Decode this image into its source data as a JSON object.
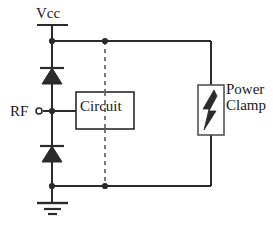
{
  "diagram": {
    "type": "schematic",
    "colors": {
      "line": "#2b2b2b",
      "dashed_line": "#6b6b6b",
      "text": "#1a1a1a",
      "background": "#ffffff",
      "fill": "#2b2b2b"
    },
    "labels": {
      "vcc": "Vcc",
      "rf": "RF",
      "circuit": "Circuit",
      "power_clamp_line1": "Power",
      "power_clamp_line2": "Clamp"
    },
    "components": [
      {
        "name": "vcc-terminal",
        "kind": "supply-rail-terminal",
        "label": "Vcc"
      },
      {
        "name": "upper-diode",
        "kind": "diode",
        "orientation": "pointing-up",
        "between": [
          "rf-node",
          "vcc-rail"
        ]
      },
      {
        "name": "lower-diode",
        "kind": "diode",
        "orientation": "pointing-up",
        "between": [
          "ground-rail",
          "rf-node"
        ]
      },
      {
        "name": "rf-terminal",
        "kind": "open-circle-port",
        "label": "RF"
      },
      {
        "name": "circuit-block",
        "kind": "rectangle-block",
        "label": "Circuit"
      },
      {
        "name": "power-clamp-block",
        "kind": "rectangle-block-with-lightning",
        "label": "Power Clamp",
        "glyph": "lightning-bolt-icon"
      },
      {
        "name": "ground-symbol",
        "kind": "earth-ground",
        "bars": 3
      }
    ],
    "nets": [
      {
        "name": "vcc-rail",
        "nodes": [
          "vcc-terminal",
          "upper-diode",
          "circuit-block",
          "power-clamp-block"
        ]
      },
      {
        "name": "ground-rail",
        "nodes": [
          "ground-symbol",
          "lower-diode",
          "circuit-block",
          "power-clamp-block"
        ]
      },
      {
        "name": "rf-node",
        "nodes": [
          "rf-terminal",
          "upper-diode",
          "lower-diode",
          "circuit-block"
        ]
      }
    ],
    "junction_dots": [
      {
        "name": "vcc-rail-left-junction",
        "x": 52,
        "y": 41
      },
      {
        "name": "vcc-rail-circuit-junction",
        "x": 105,
        "y": 41
      },
      {
        "name": "rf-node-junction",
        "x": 52,
        "y": 111
      },
      {
        "name": "ground-rail-left-junction",
        "x": 52,
        "y": 186
      },
      {
        "name": "ground-rail-circuit-junction",
        "x": 105,
        "y": 186
      }
    ]
  }
}
